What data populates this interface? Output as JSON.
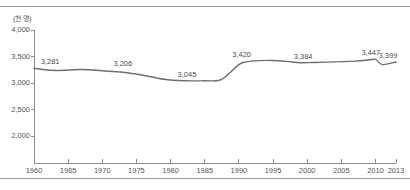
{
  "chart_data": {
    "type": "line",
    "title": "",
    "subtitle": "",
    "xlabel": "",
    "ylabel": "",
    "unit_note": "(천 명)",
    "grid": false,
    "legend": "none",
    "xlim": [
      1960,
      2013
    ],
    "ylim": [
      1500,
      4000
    ],
    "yticks": [
      "4,000",
      "3,500",
      "3,000",
      "2,500",
      "2,000"
    ],
    "ytick_values": [
      4000,
      3500,
      3000,
      2500,
      2000
    ],
    "xticks": [
      "1960",
      "1965",
      "1970",
      "1975",
      "1980",
      "1985",
      "1990",
      "1995",
      "2000",
      "2005",
      "2010",
      "2013"
    ],
    "xtick_values": [
      1960,
      1965,
      1970,
      1975,
      1980,
      1985,
      1990,
      1995,
      2000,
      2005,
      2010,
      2013
    ],
    "series": [
      {
        "name": "series-1",
        "color": "#6e6e6e",
        "x": [
          1960,
          1963,
          1967,
          1970,
          1973,
          1976,
          1979,
          1982,
          1985,
          1987,
          1988,
          1990,
          1991,
          1993,
          1995,
          1997,
          1999,
          2001,
          2004,
          2007,
          2009,
          2010,
          2011,
          2013
        ],
        "values": [
          3281,
          3240,
          3258,
          3233,
          3206,
          3150,
          3075,
          3045,
          3045,
          3050,
          3120,
          3350,
          3400,
          3425,
          3428,
          3410,
          3384,
          3390,
          3400,
          3415,
          3435,
          3447,
          3350,
          3399
        ]
      }
    ],
    "data_labels": [
      {
        "text": "3,281",
        "x": 1960.6,
        "y": 3281,
        "dy": -11,
        "dx": 12
      },
      {
        "text": "3,206",
        "x": 1973.0,
        "y": 3206,
        "dy": -13,
        "dx": 0
      },
      {
        "text": "3,045",
        "x": 1982.4,
        "y": 3045,
        "dy": -11,
        "dx": 0
      },
      {
        "text": "3,420",
        "x": 1990.4,
        "y": 3420,
        "dy": -11,
        "dx": 0
      },
      {
        "text": "3,384",
        "x": 1999.4,
        "y": 3384,
        "dy": -11,
        "dx": 0
      },
      {
        "text": "3,447",
        "x": 2009.6,
        "y": 3447,
        "dy": -11,
        "dx": -2
      },
      {
        "text": "3,399",
        "x": 2013.0,
        "y": 3399,
        "dy": -11,
        "dx": -8
      }
    ]
  }
}
